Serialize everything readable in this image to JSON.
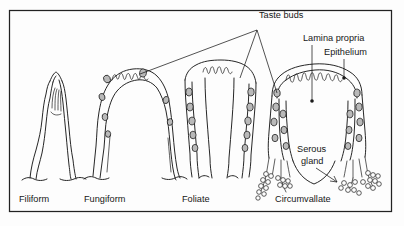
{
  "figure": {
    "frame": {
      "x": 9,
      "y": 10,
      "width": 383,
      "height": 202,
      "color": "#222222"
    }
  },
  "captions": [
    {
      "id": "filiform",
      "text": "Filiform",
      "x": 19,
      "y": 202
    },
    {
      "id": "fungiform",
      "text": "Fungiform",
      "x": 84,
      "y": 202
    },
    {
      "id": "foliate",
      "text": "Foliate",
      "x": 182,
      "y": 202
    },
    {
      "id": "circumvallate",
      "text": "Circumvallate",
      "x": 275,
      "y": 202
    }
  ],
  "annotations": [
    {
      "id": "taste-buds",
      "text": "Taste buds",
      "x": 259,
      "y": 18,
      "anchor": "start"
    },
    {
      "id": "lamina-propria",
      "text": "Lamina propria",
      "x": 303,
      "y": 41,
      "anchor": "start"
    },
    {
      "id": "epithelium",
      "text": "Epithelium",
      "x": 324,
      "y": 55,
      "anchor": "start"
    },
    {
      "id": "serous-gland-1",
      "text": "Serous",
      "x": 297,
      "y": 152,
      "anchor": "start"
    },
    {
      "id": "serous-gland-2",
      "text": "gland",
      "x": 301,
      "y": 164,
      "anchor": "start"
    }
  ],
  "leaders": {
    "taste_buds_vertex": {
      "x": 257,
      "y": 30
    },
    "taste_buds_targets": [
      {
        "id": "to-fungiform",
        "x": 140,
        "y": 74
      },
      {
        "id": "to-foliate",
        "x": 240,
        "y": 78
      },
      {
        "id": "to-circumvallate",
        "x": 277,
        "y": 93
      }
    ],
    "lamina_propria": {
      "x1": 312,
      "y1": 45,
      "x2": 312,
      "y2": 101,
      "dot_r": 1.8
    },
    "epithelium": {
      "x1": 344,
      "y1": 59,
      "x2": 344,
      "y2": 78,
      "dot_r": 1.8
    },
    "serous_gland_arrow": {
      "x1": 316,
      "y1": 168,
      "x2": 337,
      "y2": 182
    }
  },
  "papillae": [
    {
      "id": "filiform",
      "label": "Filiform",
      "taste_bud_count": 0,
      "description": "slender conical papilla without taste buds"
    },
    {
      "id": "fungiform",
      "label": "Fungiform",
      "taste_bud_count": 7,
      "description": "mushroom-shaped papilla with taste buds on the dorsal surface"
    },
    {
      "id": "foliate",
      "label": "Foliate",
      "taste_bud_count": 10,
      "description": "leaf-like folds with taste buds along the lateral walls"
    },
    {
      "id": "circumvallate",
      "label": "Circumvallate",
      "taste_bud_count": 14,
      "description": "large papilla surrounded by a trench with taste buds and serous glands"
    }
  ],
  "colors": {
    "ink": "#1a1a1a",
    "frame": "#222222",
    "background": "#fdfdfd",
    "taste_bud_fill": "#b9b9b9"
  }
}
